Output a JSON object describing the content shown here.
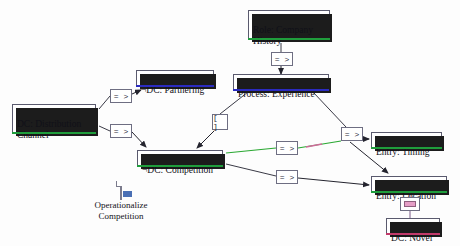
{
  "canvas": {
    "width": 460,
    "height": 246,
    "background": "#fdfdfd"
  },
  "colors": {
    "node_border": "#5a5a6e",
    "node_shadow": "#1c1c1c",
    "selection_green": "#1f9d3c",
    "selection_pink": "#c23a6b",
    "selection_blue": "#2b2bc0",
    "edge_default": "#3a3a46",
    "edge_highlight_green": "#2aa832",
    "edge_highlight_pink": "#d06a9a"
  },
  "nodes": [
    {
      "id": "role_company_history",
      "label": "Role: Company\nHistory",
      "x": 248,
      "y": 10,
      "w": 82,
      "h": 30,
      "selection": "green"
    },
    {
      "id": "dc_partnering",
      "label": "¬DC: Partnering",
      "x": 136,
      "y": 70,
      "w": 78,
      "h": 17,
      "selection": "blue"
    },
    {
      "id": "process_experience",
      "label": "Process: Experience",
      "x": 233,
      "y": 74,
      "w": 96,
      "h": 17,
      "selection": "blue"
    },
    {
      "id": "dc_distribution",
      "label": "DC: Distribution\nChannel",
      "x": 12,
      "y": 104,
      "w": 84,
      "h": 30,
      "selection": "green"
    },
    {
      "id": "dc_competition",
      "label": "¬DC: Competition",
      "x": 137,
      "y": 150,
      "w": 86,
      "h": 17,
      "selection": "green"
    },
    {
      "id": "entry_timing",
      "label": "Entry: Timing",
      "x": 371,
      "y": 132,
      "w": 71,
      "h": 17,
      "selection": "green"
    },
    {
      "id": "entry_location",
      "label": "Entry: Location",
      "x": 371,
      "y": 176,
      "w": 76,
      "h": 17,
      "selection": "green"
    },
    {
      "id": "dc_novel",
      "label": "DC: Novel",
      "x": 386,
      "y": 218,
      "w": 54,
      "h": 17,
      "selection": "pink"
    }
  ],
  "operators": [
    {
      "id": "op_partnering",
      "glyph": "= >",
      "kind": "arrow",
      "x": 110,
      "y": 89
    },
    {
      "id": "op_role_process",
      "glyph": "= >",
      "kind": "arrow",
      "x": 271,
      "y": 52
    },
    {
      "id": "op_bracket",
      "glyph": "[ ]",
      "kind": "brk",
      "x": 212,
      "y": 114
    },
    {
      "id": "op_competition",
      "glyph": "= >",
      "kind": "arrow",
      "x": 110,
      "y": 124
    },
    {
      "id": "op_timing_mid",
      "glyph": "= >",
      "kind": "arrow",
      "x": 276,
      "y": 141
    },
    {
      "id": "op_timing_top",
      "glyph": "= >",
      "kind": "arrow",
      "x": 341,
      "y": 127
    },
    {
      "id": "op_location",
      "glyph": "= >",
      "kind": "arrow",
      "x": 276,
      "y": 170
    },
    {
      "id": "op_novel_eq",
      "glyph": "=",
      "kind": "eq",
      "x": 400,
      "y": 197
    }
  ],
  "doc_item": {
    "id": "operationalize_competition",
    "caption": "Operationalize\nCompetition",
    "x": 78,
    "y": 182,
    "icon_name": "document-icon"
  },
  "edges": [
    {
      "id": "e_dist_to_op_partnering",
      "from": "dc_distribution",
      "to": "op_partnering",
      "style": "plain"
    },
    {
      "id": "e_op_partnering_to_part",
      "from": "op_partnering",
      "to": "dc_partnering",
      "style": "arrow"
    },
    {
      "id": "e_role_to_op",
      "from": "role_company_history",
      "to": "op_role_process",
      "style": "plain"
    },
    {
      "id": "e_op_to_process",
      "from": "op_role_process",
      "to": "process_experience",
      "style": "arrow"
    },
    {
      "id": "e_process_to_bracket",
      "from": "process_experience",
      "to": "op_bracket",
      "style": "plain"
    },
    {
      "id": "e_bracket_to_competition",
      "from": "op_bracket",
      "to": "dc_competition",
      "style": "arrow"
    },
    {
      "id": "e_dist_to_op_competition",
      "from": "dc_distribution",
      "to": "op_competition",
      "style": "plain"
    },
    {
      "id": "e_op_comp_to_competition",
      "from": "op_competition",
      "to": "dc_competition",
      "style": "arrow"
    },
    {
      "id": "e_competition_to_timing_mid",
      "from": "dc_competition",
      "to": "op_timing_mid",
      "style": "highlight-green"
    },
    {
      "id": "e_timing_mid_to_top",
      "from": "op_timing_mid",
      "to": "op_timing_top",
      "style": "highlight-green"
    },
    {
      "id": "e_timing_top_to_timing",
      "from": "op_timing_top",
      "to": "entry_timing",
      "style": "arrow"
    },
    {
      "id": "e_process_to_timing_top",
      "from": "process_experience",
      "to": "op_timing_top",
      "style": "plain"
    },
    {
      "id": "e_timing_top_to_location",
      "from": "op_timing_top",
      "to": "entry_location",
      "style": "arrow"
    },
    {
      "id": "e_competition_to_op_loc",
      "from": "dc_competition",
      "to": "op_location",
      "style": "plain"
    },
    {
      "id": "e_op_loc_to_location",
      "from": "op_location",
      "to": "entry_location",
      "style": "arrow"
    },
    {
      "id": "e_location_to_eq",
      "from": "entry_location",
      "to": "op_novel_eq",
      "style": "plain"
    },
    {
      "id": "e_eq_to_novel",
      "from": "op_novel_eq",
      "to": "dc_novel",
      "style": "plain"
    }
  ]
}
